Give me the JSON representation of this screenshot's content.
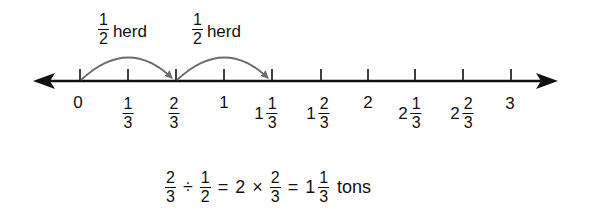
{
  "diagram": {
    "type": "number-line",
    "range": [
      0,
      3
    ],
    "step": "1/3",
    "ticks": [
      {
        "value": "0",
        "whole": "0",
        "num": "",
        "den": "",
        "x": 80
      },
      {
        "value": "1/3",
        "whole": "",
        "num": "1",
        "den": "3",
        "x": 128
      },
      {
        "value": "2/3",
        "whole": "",
        "num": "2",
        "den": "3",
        "x": 176
      },
      {
        "value": "1",
        "whole": "1",
        "num": "",
        "den": "",
        "x": 224
      },
      {
        "value": "1 1/3",
        "whole": "1",
        "num": "1",
        "den": "3",
        "x": 272
      },
      {
        "value": "1 2/3",
        "whole": "1",
        "num": "2",
        "den": "3",
        "x": 321
      },
      {
        "value": "2",
        "whole": "2",
        "num": "",
        "den": "",
        "x": 368
      },
      {
        "value": "2 1/3",
        "whole": "2",
        "num": "1",
        "den": "3",
        "x": 415
      },
      {
        "value": "2 2/3",
        "whole": "2",
        "num": "2",
        "den": "3",
        "x": 463
      },
      {
        "value": "3",
        "whole": "3",
        "num": "",
        "den": "",
        "x": 511
      }
    ],
    "jumps": [
      {
        "from": "0",
        "to": "2/3",
        "label_num": "1",
        "label_den": "2",
        "label_word": "herd"
      },
      {
        "from": "2/3",
        "to": "1 1/3",
        "label_num": "1",
        "label_den": "2",
        "label_word": "herd"
      }
    ],
    "colors": {
      "line": "#111111",
      "arc": "#6b6b6b",
      "background": "#ffffff"
    }
  },
  "equation": {
    "a_num": "2",
    "a_den": "3",
    "div_op": "÷",
    "b_num": "1",
    "b_den": "2",
    "eq1": "=",
    "mult_int": "2",
    "mult_op": "×",
    "c_num": "2",
    "c_den": "3",
    "eq2": "=",
    "result_whole": "1",
    "result_num": "1",
    "result_den": "3",
    "unit": "tons"
  }
}
